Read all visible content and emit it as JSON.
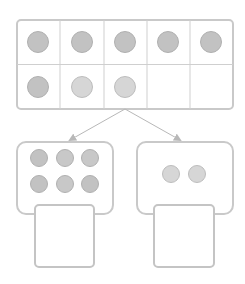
{
  "colors": {
    "background": "#ffffff",
    "frame_border": "#c9c9c9",
    "grid_line": "#cfcfcf",
    "counter_dark_fill": "#c2c2c2",
    "counter_dark_stroke": "#b0b0b0",
    "counter_light_fill": "#d6d6d6",
    "counter_light_stroke": "#bdbdbd",
    "arrow": "#b8b8b8"
  },
  "ten_frame": {
    "rows": 2,
    "columns": 5,
    "filled_count": 8,
    "cells": [
      {
        "row": 0,
        "col": 0,
        "counter": "dark"
      },
      {
        "row": 0,
        "col": 1,
        "counter": "dark"
      },
      {
        "row": 0,
        "col": 2,
        "counter": "dark"
      },
      {
        "row": 0,
        "col": 3,
        "counter": "dark"
      },
      {
        "row": 0,
        "col": 4,
        "counter": "dark"
      },
      {
        "row": 1,
        "col": 0,
        "counter": "dark"
      },
      {
        "row": 1,
        "col": 1,
        "counter": "light"
      },
      {
        "row": 1,
        "col": 2,
        "counter": "light"
      },
      {
        "row": 1,
        "col": 3,
        "counter": "none"
      },
      {
        "row": 1,
        "col": 4,
        "counter": "none"
      }
    ]
  },
  "split": {
    "left_group": {
      "counter_count": 6,
      "answer_box_value": ""
    },
    "right_group": {
      "counter_count": 2,
      "answer_box_value": ""
    }
  },
  "icons": {
    "arrow_left": "arrow-down-left-icon",
    "arrow_right": "arrow-down-right-icon"
  }
}
